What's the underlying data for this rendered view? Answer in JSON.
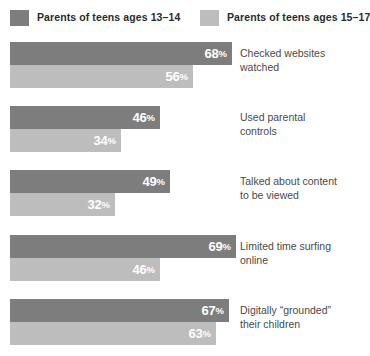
{
  "legend": {
    "entries": [
      {
        "label": "Parents of teens ages 13–14",
        "color": "#7d7d7d"
      },
      {
        "label": "Parents of teens ages 15–17",
        "color": "#bdbdbd"
      }
    ]
  },
  "groups": [
    {
      "category": "Checked websites\nwatched",
      "series_13_14": {
        "value": 68,
        "value_text": "68",
        "pct_symbol": "%"
      },
      "series_15_17": {
        "value": 56,
        "value_text": "56",
        "pct_symbol": "%"
      }
    },
    {
      "category": "Used parental\ncontrols",
      "series_13_14": {
        "value": 46,
        "value_text": "46",
        "pct_symbol": "%"
      },
      "series_15_17": {
        "value": 34,
        "value_text": "34",
        "pct_symbol": "%"
      }
    },
    {
      "category": "Talked about content\nto be viewed",
      "series_13_14": {
        "value": 49,
        "value_text": "49",
        "pct_symbol": "%"
      },
      "series_15_17": {
        "value": 32,
        "value_text": "32",
        "pct_symbol": "%"
      }
    },
    {
      "category": "Limited time surfing\nonline",
      "series_13_14": {
        "value": 69,
        "value_text": "69",
        "pct_symbol": "%"
      },
      "series_15_17": {
        "value": 46,
        "value_text": "46",
        "pct_symbol": "%"
      }
    },
    {
      "category": "Digitally “grounded”\ntheir children",
      "series_13_14": {
        "value": 67,
        "value_text": "67",
        "pct_symbol": "%"
      },
      "series_15_17": {
        "value": 63,
        "value_text": "63",
        "pct_symbol": "%"
      }
    }
  ],
  "chart_data": {
    "type": "bar",
    "orientation": "horizontal",
    "title": "",
    "subtitle": "",
    "xlabel": "",
    "ylabel": "",
    "grid": false,
    "legend_position": "top",
    "xlim": [
      0,
      100
    ],
    "value_suffix": "%",
    "categories": [
      "Checked websites watched",
      "Used parental controls",
      "Talked about content to be viewed",
      "Limited time surfing online",
      "Digitally “grounded” their children"
    ],
    "series": [
      {
        "name": "Parents of teens ages 13–14",
        "color": "#7d7d7d",
        "values": [
          68,
          46,
          49,
          69,
          67
        ]
      },
      {
        "name": "Parents of teens ages 15–17",
        "color": "#bdbdbd",
        "values": [
          56,
          34,
          32,
          46,
          63
        ]
      }
    ]
  },
  "scale": {
    "px_per_point": 3.27,
    "bar_origin_x": 10
  }
}
